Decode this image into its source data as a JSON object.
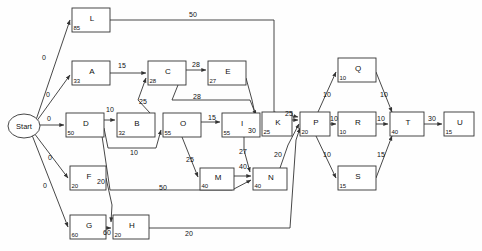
{
  "diagram": {
    "type": "activity-on-node-network",
    "start_node": {
      "id": "Start",
      "label": "Start"
    },
    "nodes": [
      {
        "id": "L",
        "label": "L",
        "duration": "85",
        "x": 72,
        "y": 8,
        "w": 38,
        "h": 24
      },
      {
        "id": "A",
        "label": "A",
        "duration": "33",
        "x": 72,
        "y": 61,
        "w": 38,
        "h": 24
      },
      {
        "id": "C",
        "label": "C",
        "duration": "28",
        "x": 148,
        "y": 61,
        "w": 38,
        "h": 24
      },
      {
        "id": "E",
        "label": "E",
        "duration": "27",
        "x": 208,
        "y": 61,
        "w": 38,
        "h": 24
      },
      {
        "id": "D",
        "label": "D",
        "duration": "50",
        "x": 66,
        "y": 113,
        "w": 38,
        "h": 24
      },
      {
        "id": "B",
        "label": "B",
        "duration": "32",
        "x": 117,
        "y": 113,
        "w": 38,
        "h": 24
      },
      {
        "id": "O",
        "label": "O",
        "duration": "55",
        "x": 163,
        "y": 113,
        "w": 38,
        "h": 24
      },
      {
        "id": "I",
        "label": "I",
        "duration": "55",
        "x": 222,
        "y": 113,
        "w": 38,
        "h": 24
      },
      {
        "id": "K",
        "label": "K",
        "duration": "25",
        "x": 262,
        "y": 112,
        "w": 30,
        "h": 24
      },
      {
        "id": "P",
        "label": "P",
        "duration": "20",
        "x": 300,
        "y": 112,
        "w": 30,
        "h": 24
      },
      {
        "id": "F",
        "label": "F",
        "duration": "20",
        "x": 70,
        "y": 166,
        "w": 36,
        "h": 24
      },
      {
        "id": "M",
        "label": "M",
        "duration": "40",
        "x": 200,
        "y": 168,
        "w": 34,
        "h": 22
      },
      {
        "id": "N",
        "label": "N",
        "duration": "40",
        "x": 253,
        "y": 168,
        "w": 34,
        "h": 22
      },
      {
        "id": "G",
        "label": "G",
        "duration": "60",
        "x": 70,
        "y": 215,
        "w": 36,
        "h": 24
      },
      {
        "id": "H",
        "label": "H",
        "duration": "20",
        "x": 113,
        "y": 215,
        "w": 36,
        "h": 24
      },
      {
        "id": "Q",
        "label": "Q",
        "duration": "10",
        "x": 338,
        "y": 58,
        "w": 38,
        "h": 24
      },
      {
        "id": "R",
        "label": "R",
        "duration": "10",
        "x": 338,
        "y": 112,
        "w": 38,
        "h": 24
      },
      {
        "id": "S",
        "label": "S",
        "duration": "15",
        "x": 338,
        "y": 166,
        "w": 38,
        "h": 24
      },
      {
        "id": "T",
        "label": "T",
        "duration": "40",
        "x": 390,
        "y": 112,
        "w": 34,
        "h": 24
      },
      {
        "id": "U",
        "label": "U",
        "duration": "15",
        "x": 444,
        "y": 112,
        "w": 30,
        "h": 24
      }
    ],
    "edges": [
      {
        "from": "Start",
        "to": "L",
        "weight": "0",
        "lx": 44,
        "ly": 58
      },
      {
        "from": "Start",
        "to": "A",
        "weight": "0",
        "lx": 48,
        "ly": 95
      },
      {
        "from": "Start",
        "to": "D",
        "weight": "0",
        "lx": 49,
        "ly": 119
      },
      {
        "from": "Start",
        "to": "F",
        "weight": "0",
        "lx": 50,
        "ly": 158
      },
      {
        "from": "Start",
        "to": "G",
        "weight": "0",
        "lx": 45,
        "ly": 186
      },
      {
        "from": "L",
        "to": "P",
        "weight": "50",
        "lx": 193,
        "ly": 15
      },
      {
        "from": "A",
        "to": "C",
        "weight": "15",
        "lx": 122,
        "ly": 66
      },
      {
        "from": "C",
        "to": "E",
        "weight": "28",
        "lx": 196,
        "ly": 65
      },
      {
        "from": "C",
        "to": "K",
        "weight": "28",
        "lx": 197,
        "ly": 97
      },
      {
        "from": "E",
        "to": "K",
        "weight": "",
        "lx": 0,
        "ly": 0
      },
      {
        "from": "D",
        "to": "B",
        "weight": "10",
        "lx": 110,
        "ly": 110
      },
      {
        "from": "D",
        "to": "O",
        "weight": "10",
        "lx": 134,
        "ly": 153
      },
      {
        "from": "B",
        "to": "C",
        "weight": "25",
        "lx": 143,
        "ly": 102
      },
      {
        "from": "O",
        "to": "I",
        "weight": "15",
        "lx": 212,
        "ly": 118
      },
      {
        "from": "O",
        "to": "M",
        "weight": "25",
        "lx": 190,
        "ly": 160
      },
      {
        "from": "I",
        "to": "K",
        "weight": "30",
        "lx": 252,
        "ly": 131
      },
      {
        "from": "I",
        "to": "N",
        "weight": "27",
        "lx": 243,
        "ly": 152
      },
      {
        "from": "D",
        "to": "N",
        "weight": "50",
        "lx": 163,
        "ly": 188
      },
      {
        "from": "F",
        "to": "H",
        "weight": "20",
        "lx": 101,
        "ly": 182
      },
      {
        "from": "G",
        "to": "H",
        "weight": "60",
        "lx": 107,
        "ly": 233
      },
      {
        "from": "H",
        "to": "P",
        "weight": "20",
        "lx": 189,
        "ly": 234
      },
      {
        "from": "M",
        "to": "N",
        "weight": "40",
        "lx": 243,
        "ly": 167
      },
      {
        "from": "N",
        "to": "P",
        "weight": "20",
        "lx": 278,
        "ly": 155
      },
      {
        "from": "K",
        "to": "P",
        "weight": "25",
        "lx": 289,
        "ly": 114
      },
      {
        "from": "P",
        "to": "Q",
        "weight": "10",
        "lx": 327,
        "ly": 95
      },
      {
        "from": "P",
        "to": "R",
        "weight": "10",
        "lx": 334,
        "ly": 119
      },
      {
        "from": "P",
        "to": "S",
        "weight": "10",
        "lx": 327,
        "ly": 155
      },
      {
        "from": "Q",
        "to": "T",
        "weight": "10",
        "lx": 384,
        "ly": 95
      },
      {
        "from": "R",
        "to": "T",
        "weight": "10",
        "lx": 381,
        "ly": 119
      },
      {
        "from": "S",
        "to": "T",
        "weight": "15",
        "lx": 381,
        "ly": 155
      },
      {
        "from": "T",
        "to": "U",
        "weight": "30",
        "lx": 432,
        "ly": 119
      }
    ],
    "colors": {
      "stroke": "#333333",
      "node_fill": "#ffffff",
      "text": "#111111",
      "background": "#ffffff"
    }
  }
}
